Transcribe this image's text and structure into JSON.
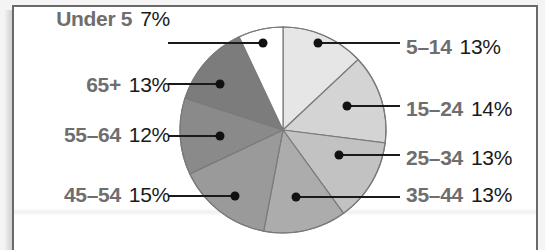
{
  "chart_data": {
    "type": "pie",
    "title": "",
    "start_angle_deg": 0,
    "direction": "clockwise",
    "categories": [
      "5–14",
      "15–24",
      "25–34",
      "35–44",
      "45–54",
      "55–64",
      "65+",
      "Under 5"
    ],
    "values": [
      13,
      14,
      13,
      13,
      15,
      12,
      13,
      7
    ],
    "unit": "%",
    "labels": [
      {
        "category": "Under 5",
        "value": "7%",
        "side": "left"
      },
      {
        "category": "65+",
        "value": "13%",
        "side": "left"
      },
      {
        "category": "55–64",
        "value": "12%",
        "side": "left"
      },
      {
        "category": "45–54",
        "value": "15%",
        "side": "left"
      },
      {
        "category": "5–14",
        "value": "13%",
        "side": "right"
      },
      {
        "category": "15–24",
        "value": "14%",
        "side": "right"
      },
      {
        "category": "25–34",
        "value": "13%",
        "side": "right"
      },
      {
        "category": "35–44",
        "value": "13%",
        "side": "right"
      }
    ],
    "slice_colors": [
      "#e6e6e6",
      "#d4d4d4",
      "#c2c2c2",
      "#acacac",
      "#9a9a9a",
      "#8a8a8a",
      "#7c7c7c",
      "#ffffff"
    ],
    "legend": "none (direct labels with leader lines)"
  },
  "labels": {
    "under5": {
      "cat": "Under 5",
      "pct": "7%"
    },
    "a65": {
      "cat": "65+",
      "pct": "13%"
    },
    "a55": {
      "cat": "55–64",
      "pct": "12%"
    },
    "a45": {
      "cat": "45–54",
      "pct": "15%"
    },
    "a5": {
      "cat": "5–14",
      "pct": "13%"
    },
    "a15": {
      "cat": "15–24",
      "pct": "14%"
    },
    "a25": {
      "cat": "25–34",
      "pct": "13%"
    },
    "a35": {
      "cat": "35–44",
      "pct": "13%"
    }
  }
}
